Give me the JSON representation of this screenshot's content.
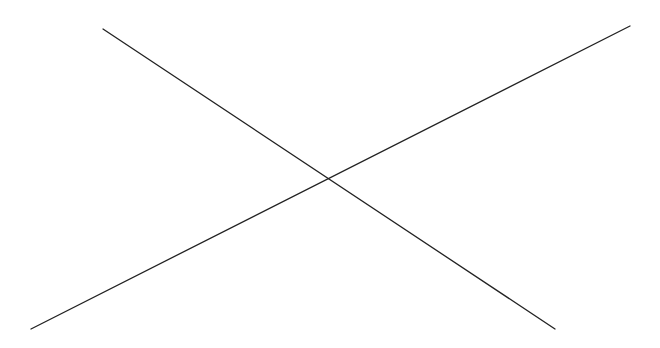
{
  "canvas": {
    "width": 660,
    "height": 348,
    "background": "#ffffff"
  },
  "lines": [
    {
      "name": "descending-line",
      "x1": 103,
      "y1": 29,
      "x2": 555,
      "y2": 329,
      "color": "#222222",
      "width": 1.3
    },
    {
      "name": "ascending-line",
      "x1": 31,
      "y1": 329,
      "x2": 630,
      "y2": 26,
      "color": "#222222",
      "width": 1.3
    }
  ],
  "intersection": {
    "x": 328,
    "y": 179
  }
}
